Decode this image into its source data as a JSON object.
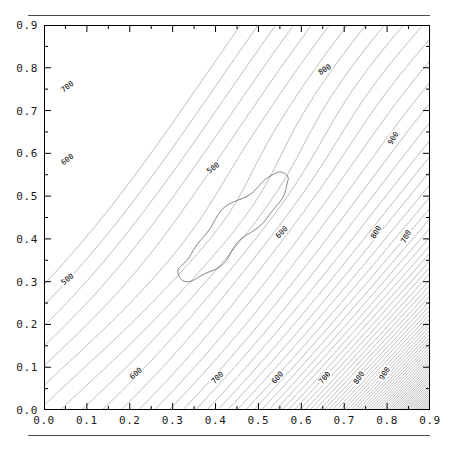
{
  "figure": {
    "kind": "contour-plot",
    "rule_top": true,
    "rule_bottom": true
  },
  "chart_data": {
    "type": "contour",
    "title": "",
    "subtitle": "",
    "xlabel": "",
    "ylabel": "",
    "xlim": [
      0.0,
      0.9
    ],
    "ylim": [
      0.0,
      0.9
    ],
    "grid": false,
    "legend": "none",
    "frame": true,
    "minor_tick_step": 0.05,
    "major_tick_step": 0.1,
    "x_ticks": [
      "0.0",
      "0.1",
      "0.2",
      "0.3",
      "0.4",
      "0.5",
      "0.6",
      "0.7",
      "0.8",
      "0.9"
    ],
    "y_ticks": [
      "0.0",
      "0.1",
      "0.2",
      "0.3",
      "0.4",
      "0.5",
      "0.6",
      "0.7",
      "0.8",
      "0.9"
    ],
    "x_tick_values": [
      0.0,
      0.1,
      0.2,
      0.3,
      0.4,
      0.5,
      0.6,
      0.7,
      0.8,
      0.9
    ],
    "y_tick_values": [
      0.0,
      0.1,
      0.2,
      0.3,
      0.4,
      0.5,
      0.6,
      0.7,
      0.8,
      0.9
    ],
    "contour_orientation": "anti-diagonal bands increasing toward lower-right corner",
    "closed_contour_present": true,
    "closed_contour_description": "elongated lobe from about (0.31,0.29) to (0.58,0.56)",
    "dense_region": "lower-right corner near (0.9, 0.0)",
    "contour_labels": [
      {
        "text": "700",
        "x": 0.055,
        "y": 0.755,
        "angle": -38
      },
      {
        "text": "600",
        "x": 0.055,
        "y": 0.585,
        "angle": -38
      },
      {
        "text": "500",
        "x": 0.055,
        "y": 0.305,
        "angle": -40
      },
      {
        "text": "500",
        "x": 0.395,
        "y": 0.565,
        "angle": -38
      },
      {
        "text": "600",
        "x": 0.555,
        "y": 0.415,
        "angle": -44
      },
      {
        "text": "600",
        "x": 0.215,
        "y": 0.085,
        "angle": -42
      },
      {
        "text": "700",
        "x": 0.405,
        "y": 0.075,
        "angle": -46
      },
      {
        "text": "800",
        "x": 0.655,
        "y": 0.795,
        "angle": -32
      },
      {
        "text": "900",
        "x": 0.815,
        "y": 0.635,
        "angle": -58
      },
      {
        "text": "800",
        "x": 0.775,
        "y": 0.415,
        "angle": -60
      },
      {
        "text": "700",
        "x": 0.845,
        "y": 0.405,
        "angle": -62
      },
      {
        "text": "600",
        "x": 0.545,
        "y": 0.075,
        "angle": -48
      },
      {
        "text": "700",
        "x": 0.655,
        "y": 0.075,
        "angle": -52
      },
      {
        "text": "800",
        "x": 0.735,
        "y": 0.075,
        "angle": -56
      },
      {
        "text": "900",
        "x": 0.795,
        "y": 0.085,
        "angle": -60
      }
    ],
    "levels": [
      500,
      550,
      600,
      650,
      700,
      750,
      800,
      850,
      900,
      950,
      1000,
      1050,
      1100,
      1150,
      1200,
      1250,
      1300
    ],
    "labeled_levels": [
      500,
      600,
      700,
      800,
      900
    ],
    "colors": {
      "line": "#000000",
      "axis": "#000000",
      "text": "#1a1a1a",
      "rule": "#4a4a4a"
    }
  }
}
